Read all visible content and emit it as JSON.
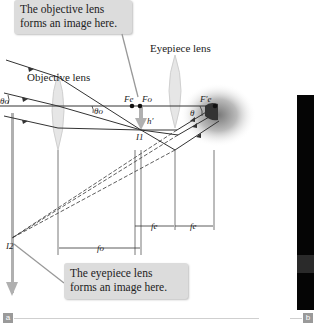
{
  "figure": {
    "callouts": {
      "objective_image": "The objective lens forms an image here.",
      "eyepiece_image": "The eyepiece lens forms an image here."
    },
    "labels": {
      "objective_lens": "Objective lens",
      "eyepiece_lens": "Eyepiece lens",
      "theta_o_left": "θo",
      "theta_o": "θo",
      "theta": "θ",
      "h_prime": "h′",
      "F_e": "Fe",
      "F_o": "Fo",
      "F_e_prime": "F′e",
      "I1": "I1",
      "I2": "I2",
      "f_o": "fo",
      "f_e_1": "fe",
      "f_e_2": "fe"
    },
    "panel_labels": {
      "a": "a",
      "b": "b"
    },
    "colors": {
      "callout_bg": "#dcdcdc",
      "ray": "#333333",
      "lens": "#e6e6e6",
      "arrow_image": "#b0b0b0",
      "panel_b_bg": "#050505"
    }
  }
}
